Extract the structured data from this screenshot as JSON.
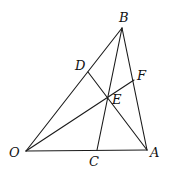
{
  "diagram": {
    "type": "geometry",
    "points": {
      "O": {
        "label": "O",
        "x": 26,
        "y": 151,
        "lx": 9,
        "ly": 157
      },
      "A": {
        "label": "A",
        "x": 147,
        "y": 150,
        "lx": 150,
        "ly": 157
      },
      "B": {
        "label": "B",
        "x": 122,
        "y": 28,
        "lx": 119,
        "ly": 22
      },
      "C": {
        "label": "C",
        "x": 97,
        "y": 150,
        "lx": 89,
        "ly": 166
      },
      "D": {
        "label": "D",
        "x": 88,
        "y": 72,
        "lx": 75,
        "ly": 70
      },
      "E": {
        "label": "E",
        "x": 107,
        "y": 97,
        "lx": 112,
        "ly": 104
      },
      "F": {
        "label": "F",
        "x": 134,
        "y": 80,
        "lx": 137,
        "ly": 80
      }
    },
    "segments": [
      {
        "name": "OB",
        "from": "O",
        "to": "B"
      },
      {
        "name": "OA",
        "from": "O",
        "to": "A"
      },
      {
        "name": "BA",
        "from": "B",
        "to": "A"
      },
      {
        "name": "BC",
        "from": "B",
        "to": "C"
      },
      {
        "name": "DA",
        "from": "D",
        "to": "A"
      },
      {
        "name": "OF",
        "from": "O",
        "to": "F"
      }
    ]
  }
}
